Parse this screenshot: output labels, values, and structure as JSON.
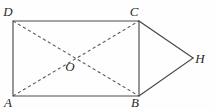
{
  "figure": {
    "background_color": "#fefefe",
    "stroke_color_solid": "#4a4a4a",
    "stroke_color_dashed": "#555555",
    "label_color": "#2b2b2b",
    "labels": {
      "D": "D",
      "C": "C",
      "A": "A",
      "B": "B",
      "H": "H",
      "O": "O"
    },
    "points": {
      "D": {
        "x": 13,
        "y": 21
      },
      "C": {
        "x": 139,
        "y": 21
      },
      "A": {
        "x": 13,
        "y": 96
      },
      "B": {
        "x": 139,
        "y": 96
      },
      "H": {
        "x": 193,
        "y": 58
      },
      "O": {
        "x": 76,
        "y": 58
      }
    },
    "label_positions": {
      "D": {
        "x": 8,
        "y": 16
      },
      "C": {
        "x": 134,
        "y": 16
      },
      "A": {
        "x": 8,
        "y": 107
      },
      "B": {
        "x": 135,
        "y": 107
      },
      "H": {
        "x": 200,
        "y": 63
      },
      "O": {
        "x": 70,
        "y": 71
      }
    },
    "edges": {
      "rectangle_path": "M 13 21 L 139 21 L 139 96 L 13 96 Z",
      "triangle_ch": "M 139 21 L 193 58",
      "triangle_hb": "M 193 58 L 139 96",
      "diagonal_ac": "M 13 96 L 139 21",
      "diagonal_db": "M 13 21 L 139 96"
    },
    "edge_names": {
      "rectangle": "rectangle-abcd",
      "triangle_top": "segment-ch",
      "triangle_bottom": "segment-hb",
      "diag_ac": "diagonal-ac",
      "diag_db": "diagonal-db"
    }
  }
}
